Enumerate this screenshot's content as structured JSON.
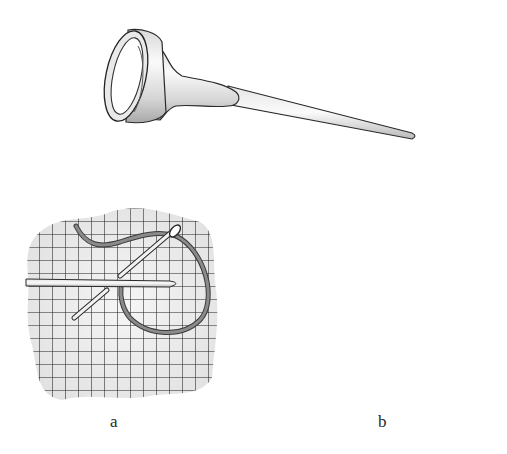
{
  "figure": {
    "panels": [
      {
        "id": "a",
        "label": "a",
        "content": "Needle and threaded tool passing through grid fabric with looped thread"
      },
      {
        "id": "b",
        "label": "b",
        "content": "Needle lying on grid fabric with a small stitch wrapped around it"
      }
    ],
    "colors": {
      "ink": "#222222",
      "fabric": "#ececec",
      "thread": "#6f6f6f",
      "metal_light": "#f4f4f4",
      "metal_shade": "#bdbdbd"
    }
  }
}
